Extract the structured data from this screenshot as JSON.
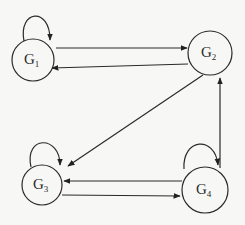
{
  "diagram": {
    "type": "directed-graph",
    "nodes": [
      {
        "id": "G1",
        "base": "G",
        "sub": "1",
        "cx": 33,
        "cy": 60,
        "r": 21
      },
      {
        "id": "G2",
        "base": "G",
        "sub": "2",
        "cx": 210,
        "cy": 53,
        "r": 22
      },
      {
        "id": "G3",
        "base": "G",
        "sub": "3",
        "cx": 42,
        "cy": 185,
        "r": 20
      },
      {
        "id": "G4",
        "base": "G",
        "sub": "4",
        "cx": 205,
        "cy": 190,
        "r": 23
      }
    ],
    "edges": [
      {
        "from": "G1",
        "to": "G1",
        "kind": "self-loop"
      },
      {
        "from": "G1",
        "to": "G2"
      },
      {
        "from": "G2",
        "to": "G1"
      },
      {
        "from": "G2",
        "to": "G3"
      },
      {
        "from": "G4",
        "to": "G2"
      },
      {
        "from": "G3",
        "to": "G3",
        "kind": "self-loop"
      },
      {
        "from": "G4",
        "to": "G3"
      },
      {
        "from": "G3",
        "to": "G4"
      },
      {
        "from": "G4",
        "to": "G4",
        "kind": "self-loop"
      }
    ]
  },
  "labels": {
    "g1": {
      "base": "G",
      "sub": "1"
    },
    "g2": {
      "base": "G",
      "sub": "2"
    },
    "g3": {
      "base": "G",
      "sub": "3"
    },
    "g4": {
      "base": "G",
      "sub": "4"
    }
  }
}
